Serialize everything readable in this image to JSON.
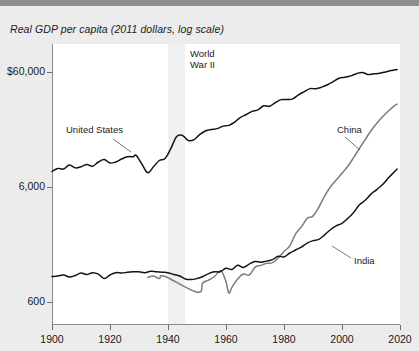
{
  "chart_data": {
    "type": "line",
    "title": "Real GDP per capita (2011 dollars, log scale)",
    "xlabel": "",
    "ylabel": "",
    "scale": "log",
    "grid": false,
    "legend_position": "inline-annotations",
    "xlim": [
      1900,
      2020
    ],
    "ylim": [
      400,
      90000
    ],
    "xticks": [
      1900,
      1920,
      1940,
      1960,
      1980,
      2000,
      2020
    ],
    "xtick_labels": [
      "1900",
      "1920",
      "1940",
      "1960",
      "1980",
      "2000",
      "2020"
    ],
    "yticks": [
      600,
      6000,
      60000
    ],
    "ytick_labels": [
      "600",
      "6,000",
      "$60,000"
    ],
    "annotations": [
      {
        "label": "World\nWar II",
        "x": 1947,
        "kind": "shaded-band-label"
      },
      {
        "label": "United States",
        "x": 1916,
        "y": 17000,
        "kind": "series-label"
      },
      {
        "label": "China",
        "x": 2003,
        "y": 19000,
        "kind": "series-label"
      },
      {
        "label": "India",
        "x": 2005,
        "y": 2300,
        "kind": "series-label"
      }
    ],
    "shaded_regions": [
      {
        "name": "World War II",
        "x_start": 1940,
        "x_end": 1946,
        "color": "#f0f0f0"
      }
    ],
    "series": [
      {
        "name": "United States",
        "color": "#141414",
        "x": [
          1900,
          1902,
          1904,
          1906,
          1908,
          1910,
          1912,
          1914,
          1916,
          1918,
          1920,
          1922,
          1924,
          1926,
          1928,
          1929,
          1931,
          1933,
          1935,
          1937,
          1939,
          1941,
          1943,
          1945,
          1947,
          1949,
          1951,
          1953,
          1955,
          1957,
          1959,
          1961,
          1963,
          1965,
          1967,
          1969,
          1971,
          1973,
          1975,
          1977,
          1979,
          1981,
          1983,
          1985,
          1987,
          1989,
          1991,
          1993,
          1995,
          1997,
          1999,
          2001,
          2003,
          2005,
          2007,
          2009,
          2011,
          2013,
          2015,
          2017,
          2019
        ],
        "values": [
          8200,
          8700,
          8600,
          9300,
          8800,
          9000,
          9400,
          9100,
          9900,
          10400,
          9700,
          9900,
          10500,
          11000,
          11000,
          11300,
          9500,
          8000,
          9000,
          10200,
          10600,
          13000,
          16500,
          16800,
          15200,
          15500,
          17200,
          18500,
          19000,
          19300,
          20300,
          20600,
          22000,
          24200,
          25600,
          27300,
          28100,
          30500,
          30200,
          32500,
          34500,
          34600,
          35000,
          38000,
          40500,
          43000,
          42900,
          44300,
          46500,
          49500,
          53000,
          54000,
          55500,
          58000,
          59500,
          57000,
          57800,
          58500,
          60000,
          61800,
          63000
        ]
      },
      {
        "name": "China",
        "color": "#7d7d7d",
        "x": [
          1933,
          1935,
          1937,
          1939,
          1950,
          1952,
          1954,
          1956,
          1958,
          1959,
          1960,
          1961,
          1962,
          1964,
          1966,
          1968,
          1970,
          1972,
          1974,
          1976,
          1978,
          1980,
          1982,
          1984,
          1986,
          1988,
          1990,
          1992,
          1994,
          1996,
          1998,
          2000,
          2002,
          2004,
          2006,
          2008,
          2010,
          2012,
          2014,
          2016,
          2018,
          2019
        ],
        "values": [
          980,
          1010,
          960,
          1000,
          730,
          880,
          930,
          1000,
          1120,
          1050,
          900,
          720,
          800,
          950,
          1050,
          1030,
          1200,
          1250,
          1300,
          1320,
          1450,
          1650,
          1850,
          2350,
          2700,
          3200,
          3350,
          4000,
          5000,
          6000,
          6900,
          7900,
          9100,
          10800,
          13000,
          15500,
          18500,
          21500,
          24500,
          27500,
          30500,
          31500
        ]
      },
      {
        "name": "India",
        "color": "#141414",
        "x": [
          1900,
          1902,
          1904,
          1906,
          1908,
          1910,
          1912,
          1914,
          1916,
          1918,
          1920,
          1922,
          1924,
          1926,
          1928,
          1930,
          1932,
          1934,
          1936,
          1938,
          1940,
          1942,
          1944,
          1946,
          1948,
          1950,
          1952,
          1954,
          1956,
          1958,
          1960,
          1962,
          1964,
          1966,
          1968,
          1970,
          1972,
          1974,
          1976,
          1978,
          1980,
          1982,
          1984,
          1986,
          1988,
          1990,
          1992,
          1994,
          1996,
          1998,
          2000,
          2002,
          2004,
          2006,
          2008,
          2010,
          2012,
          2014,
          2016,
          2018,
          2019
        ],
        "values": [
          1000,
          1010,
          1030,
          990,
          1020,
          1070,
          1040,
          1080,
          1050,
          960,
          1030,
          1080,
          1070,
          1090,
          1100,
          1100,
          1080,
          1110,
          1100,
          1090,
          1080,
          1040,
          1010,
          950,
          940,
          960,
          1000,
          1060,
          1100,
          1100,
          1180,
          1150,
          1250,
          1200,
          1280,
          1350,
          1330,
          1360,
          1400,
          1500,
          1480,
          1600,
          1700,
          1800,
          1950,
          2050,
          2100,
          2300,
          2550,
          2750,
          2900,
          3200,
          3600,
          4200,
          4600,
          5200,
          5700,
          6300,
          7200,
          8100,
          8600
        ]
      }
    ]
  },
  "axis": {
    "y_labels": [
      "$60,000",
      "6,000",
      "600"
    ],
    "x_labels": [
      "1900",
      "1920",
      "1940",
      "1960",
      "1980",
      "2000",
      "2020"
    ]
  },
  "labels": {
    "title": "Real GDP per capita (2011 dollars, log scale)",
    "wwii": "World\nWar II",
    "united_states": "United States",
    "china": "China",
    "india": "India"
  },
  "colors": {
    "page_background": "#ececec",
    "plot_background": "#ffffff",
    "topbar": "#8e8e8e",
    "band": "#f0f0f0",
    "line_dark": "#141414",
    "line_gray": "#7d7d7d",
    "axis": "#8a8a8a",
    "text": "#1a1a1a"
  }
}
